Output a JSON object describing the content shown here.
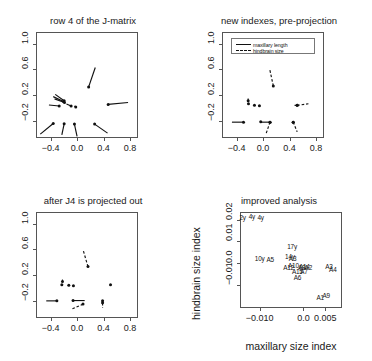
{
  "figure": {
    "width": 372,
    "height": 361,
    "background": "#ffffff",
    "foreground": "#000000"
  },
  "chart_data": [
    {
      "id": "panel-row4-jmatrix",
      "type": "scatter",
      "title": "row 4 of the J-matrix",
      "xlabel": "",
      "ylabel": "",
      "xlim": [
        -0.62,
        0.92
      ],
      "ylim": [
        -0.46,
        1.18
      ],
      "xticks": [
        -0.4,
        0.0,
        0.4,
        0.8
      ],
      "xticklabels": [
        "-0.4",
        "0.0",
        "0.4",
        "0.8"
      ],
      "yticks": [
        -0.2,
        0.2,
        0.6,
        1.0
      ],
      "yticklabels": [
        "-0.2",
        "0.2",
        "0.6",
        "1.0"
      ],
      "grid": false,
      "legend": null,
      "series": [
        {
          "name": "maxillary length",
          "style": "solid",
          "vectors": [
            {
              "x": 0.175,
              "y": 0.33,
              "dx": 0.1,
              "dy": 0.3
            },
            {
              "x": -0.195,
              "y": 0.115,
              "dx": -0.135,
              "dy": 0.1
            },
            {
              "x": -0.205,
              "y": 0.105,
              "dx": -0.155,
              "dy": 0.075
            },
            {
              "x": -0.19,
              "y": 0.09,
              "dx": -0.15,
              "dy": 0.055
            },
            {
              "x": -0.27,
              "y": 0.035,
              "dx": -0.155,
              "dy": 0.015
            },
            {
              "x": -0.09,
              "y": 0.035,
              "dx": -0.07,
              "dy": 0.03
            },
            {
              "x": -0.02,
              "y": 0.02,
              "dx": -0.02,
              "dy": 0.015
            },
            {
              "x": 0.47,
              "y": 0.06,
              "dx": 0.3,
              "dy": 0.03
            },
            {
              "x": -0.36,
              "y": -0.235,
              "dx": -0.195,
              "dy": -0.165
            },
            {
              "x": -0.195,
              "y": -0.24,
              "dx": -0.035,
              "dy": -0.17
            },
            {
              "x": -0.04,
              "y": -0.245,
              "dx": 0.04,
              "dy": -0.19
            },
            {
              "x": 0.265,
              "y": -0.245,
              "dx": 0.195,
              "dy": -0.14
            }
          ]
        }
      ]
    },
    {
      "id": "panel-new-indexes",
      "type": "scatter",
      "title": "new indexes, pre-projection",
      "xlabel": "",
      "ylabel": "",
      "xlim": [
        -0.62,
        0.92
      ],
      "ylim": [
        -0.46,
        1.18
      ],
      "xticks": [
        -0.4,
        0.0,
        0.4,
        0.8
      ],
      "xticklabels": [
        "-0.4",
        "0.0",
        "0.4",
        "0.8"
      ],
      "yticks": [
        -0.2,
        0.2,
        0.6,
        1.0
      ],
      "yticklabels": [
        "-0.2",
        "0.2",
        "0.6",
        "1.0"
      ],
      "grid": false,
      "legend": {
        "position": "top-left-inside",
        "entries": [
          {
            "label": "maxillary length",
            "style": "solid"
          },
          {
            "label": "hindbrain size",
            "style": "dashed"
          }
        ]
      },
      "series": [
        {
          "name": "maxillary length",
          "style": "solid",
          "vectors": [
            {
              "x": -0.225,
              "y": 0.115,
              "dx": 0.0,
              "dy": 0.035
            },
            {
              "x": -0.22,
              "y": 0.07,
              "dx": -0.01,
              "dy": 0.0
            },
            {
              "x": -0.13,
              "y": 0.045,
              "dx": 0.0,
              "dy": 0.0
            },
            {
              "x": -0.055,
              "y": 0.04,
              "dx": 0.0,
              "dy": 0.0
            },
            {
              "x": -0.295,
              "y": -0.215,
              "dx": -0.175,
              "dy": 0.0
            },
            {
              "x": -0.035,
              "y": -0.21,
              "dx": 0.0,
              "dy": 0.0
            },
            {
              "x": 0.105,
              "y": -0.215,
              "dx": -0.14,
              "dy": 0.0
            },
            {
              "x": 0.455,
              "y": -0.215,
              "dx": 0.0,
              "dy": 0.0
            },
            {
              "x": 0.515,
              "y": 0.045,
              "dx": -0.04,
              "dy": 0.0
            }
          ]
        },
        {
          "name": "hindbrain size",
          "style": "dashed",
          "vectors": [
            {
              "x": 0.155,
              "y": 0.345,
              "dx": -0.055,
              "dy": 0.26
            },
            {
              "x": 0.515,
              "y": 0.045,
              "dx": 0.17,
              "dy": 0.025
            },
            {
              "x": 0.105,
              "y": -0.215,
              "dx": -0.06,
              "dy": -0.18
            },
            {
              "x": 0.455,
              "y": -0.215,
              "dx": 0.06,
              "dy": -0.15
            }
          ]
        }
      ]
    },
    {
      "id": "panel-j4-projected-out",
      "type": "scatter",
      "title": "after J4 is projected out",
      "xlabel": "",
      "ylabel": "",
      "xlim": [
        -0.62,
        0.92
      ],
      "ylim": [
        -0.46,
        1.18
      ],
      "xticks": [
        -0.4,
        0.0,
        0.4,
        0.8
      ],
      "xticklabels": [
        "-0.4",
        "0.0",
        "0.4",
        "0.8"
      ],
      "yticks": [
        -0.2,
        0.2,
        0.6,
        1.0
      ],
      "yticklabels": [
        "-0.2",
        "0.2",
        "0.6",
        "1.0"
      ],
      "grid": false,
      "legend": null,
      "series": [
        {
          "name": "maxillary length",
          "style": "solid",
          "vectors": [
            {
              "x": -0.22,
              "y": 0.105,
              "dx": 0.0,
              "dy": 0.03
            },
            {
              "x": -0.23,
              "y": 0.055,
              "dx": 0.0,
              "dy": 0.0
            },
            {
              "x": -0.125,
              "y": 0.045,
              "dx": 0.0,
              "dy": 0.0
            },
            {
              "x": -0.055,
              "y": 0.04,
              "dx": 0.0,
              "dy": 0.0
            },
            {
              "x": 0.505,
              "y": 0.055,
              "dx": 0.0,
              "dy": 0.0
            },
            {
              "x": -0.305,
              "y": -0.195,
              "dx": -0.16,
              "dy": 0.0
            },
            {
              "x": -0.06,
              "y": -0.19,
              "dx": 0.175,
              "dy": 0.0
            },
            {
              "x": 0.385,
              "y": -0.195,
              "dx": 0.0,
              "dy": 0.0
            }
          ]
        },
        {
          "name": "hindbrain size",
          "style": "dashed",
          "vectors": [
            {
              "x": 0.165,
              "y": 0.335,
              "dx": -0.07,
              "dy": 0.245
            },
            {
              "x": 0.09,
              "y": -0.245,
              "dx": -0.175,
              "dy": -0.08
            },
            {
              "x": 0.385,
              "y": -0.225,
              "dx": 0.0,
              "dy": -0.075
            }
          ]
        }
      ]
    },
    {
      "id": "panel-improved-analysis",
      "type": "scatter",
      "title": "improved analysis",
      "xlabel": "maxillary size index",
      "ylabel": "hindbrain size index",
      "xlim": [
        -0.0145,
        0.0088
      ],
      "ylim": [
        -0.0205,
        0.0235
      ],
      "xticks": [
        -0.01,
        0.0,
        0.005
      ],
      "xticklabels": [
        "-0.010",
        "0.0",
        "0.005"
      ],
      "yticks": [
        -0.01,
        0.0,
        0.01,
        0.02
      ],
      "yticklabels": [
        "-0.01",
        "0.0",
        "0.01",
        "0.02"
      ],
      "grid": false,
      "legend": null,
      "points": [
        {
          "label": "2y",
          "x": -0.0139,
          "y": 0.0213
        },
        {
          "label": "4y",
          "x": -0.0118,
          "y": 0.0218
        },
        {
          "label": "4y",
          "x": -0.0098,
          "y": 0.0214
        },
        {
          "label": "17y",
          "x": -0.0026,
          "y": 0.0078
        },
        {
          "label": "10y",
          "x": -0.01,
          "y": 0.0022
        },
        {
          "label": "A5",
          "x": -0.0076,
          "y": 0.0018
        },
        {
          "label": "14y",
          "x": -0.0031,
          "y": 0.0032
        },
        {
          "label": "A3",
          "x": -0.0025,
          "y": 0.0024
        },
        {
          "label": "A10",
          "x": -0.0023,
          "y": -0.0006
        },
        {
          "label": "A12",
          "x": -0.0034,
          "y": -0.0015
        },
        {
          "label": "A8",
          "x": -0.0004,
          "y": -0.0015
        },
        {
          "label": "A14",
          "x": 0.0002,
          "y": -0.0014
        },
        {
          "label": "A2",
          "x": 0.0011,
          "y": -0.0015
        },
        {
          "label": "A3",
          "x": 0.0058,
          "y": -0.0012
        },
        {
          "label": "A4",
          "x": 0.0067,
          "y": -0.0028
        },
        {
          "label": "A15",
          "x": -0.0014,
          "y": -0.0036
        },
        {
          "label": "A7",
          "x": 0.0001,
          "y": -0.0035
        },
        {
          "label": "A6",
          "x": -0.0014,
          "y": -0.0064
        },
        {
          "label": "A1",
          "x": 0.0038,
          "y": -0.0154
        },
        {
          "label": "A9",
          "x": 0.0052,
          "y": -0.0145
        }
      ]
    }
  ]
}
